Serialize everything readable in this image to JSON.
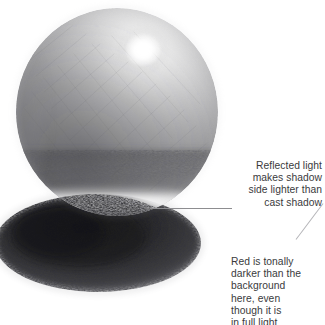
{
  "figure": {
    "medium": "graphite-pencil-drawing",
    "background_color": "#ffffff",
    "text_color": "#3a3a3c",
    "leader_color": "#8d8d90"
  },
  "annotations": [
    {
      "id": "reflected-light",
      "text": "Reflected light\nmakes shadow\nside lighter than\ncast shadow",
      "align": "right",
      "leader": "horizontal"
    },
    {
      "id": "red-tone",
      "text": "Red is tonally\ndarker than the\nbackground\nhere, even\nthough it is\nin full light",
      "align": "left",
      "leader": "diagonal"
    }
  ],
  "drawing": {
    "sphere": {
      "center_x": 117,
      "center_y": 112,
      "radius_x": 101,
      "radius_y": 104,
      "highlight_x": 143,
      "highlight_y": 50,
      "highlight_radius": 16,
      "light_direction": "upper-right",
      "tone_light": "#d9d9da",
      "tone_mid": "#9a9a9c",
      "tone_core_shadow": "#4a4a4c"
    },
    "cast_shadow": {
      "center_x": 98,
      "center_y": 243,
      "radius_x": 102,
      "radius_y": 48,
      "tone": "#2a2a2c"
    },
    "reflected_band": {
      "y": 206,
      "tone": "#e8e8e9"
    }
  }
}
